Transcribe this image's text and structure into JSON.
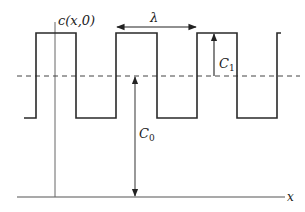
{
  "diagram": {
    "labels": {
      "function": "c(x,0)",
      "wavelength": "λ",
      "amplitude_symbol": "C",
      "amplitude_sub": "1",
      "mean_symbol": "C",
      "mean_sub": "0",
      "x_axis": "x"
    },
    "levels": {
      "high_y": 33,
      "mean_y": 76,
      "low_y": 118,
      "axis_y": 197
    },
    "colors": {
      "stroke": "#2a2a2a",
      "axis": "#555555",
      "dashed": "#444444",
      "background": "#ffffff"
    }
  }
}
